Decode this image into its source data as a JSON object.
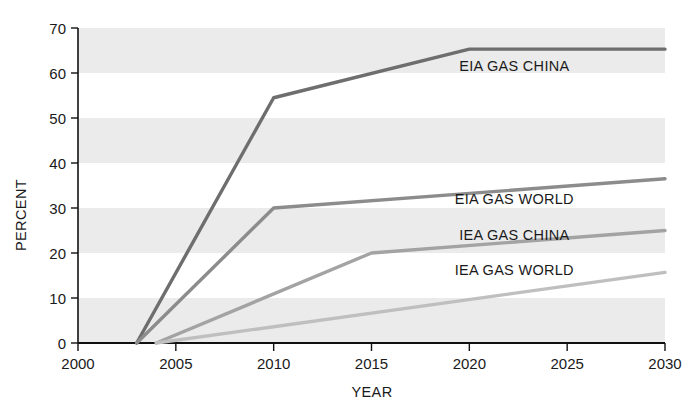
{
  "chart_data": {
    "type": "line",
    "title": "",
    "xlabel": "YEAR",
    "ylabel": "PERCENT",
    "xlim": [
      2000,
      2030
    ],
    "ylim": [
      0,
      70
    ],
    "xticks": [
      2000,
      2005,
      2010,
      2015,
      2020,
      2025,
      2030
    ],
    "yticks": [
      0,
      10,
      20,
      30,
      40,
      50,
      60,
      70
    ],
    "grid": false,
    "banding": "alternating horizontal grey bands every 20 percent starting at 0",
    "legend_position": "inline-annotations",
    "series": [
      {
        "name": "EIA GAS CHINA",
        "color": "#6e6e6e",
        "label_x": 2022.3,
        "label_y": 61.5,
        "points": [
          {
            "x": 2003.0,
            "y": 0.0
          },
          {
            "x": 2010.0,
            "y": 54.5
          },
          {
            "x": 2020.0,
            "y": 65.3
          },
          {
            "x": 2030.0,
            "y": 65.3
          }
        ]
      },
      {
        "name": "EIA GAS WORLD",
        "color": "#8c8c8c",
        "label_x": 2022.3,
        "label_y": 32.0,
        "points": [
          {
            "x": 2003.0,
            "y": 0.0
          },
          {
            "x": 2010.0,
            "y": 30.0
          },
          {
            "x": 2030.0,
            "y": 36.5
          }
        ]
      },
      {
        "name": "IEA GAS CHINA",
        "color": "#a3a3a3",
        "label_x": 2022.3,
        "label_y": 24.0,
        "points": [
          {
            "x": 2004.0,
            "y": 0.0
          },
          {
            "x": 2015.0,
            "y": 20.0
          },
          {
            "x": 2030.0,
            "y": 25.0
          }
        ]
      },
      {
        "name": "IEA GAS WORLD",
        "color": "#bfbfbf",
        "label_x": 2022.3,
        "label_y": 16.2,
        "points": [
          {
            "x": 2004.0,
            "y": 0.0
          },
          {
            "x": 2030.0,
            "y": 15.7
          }
        ]
      }
    ]
  },
  "colors": {
    "axis": "#111111",
    "band": "#ebebeb",
    "plot_background": "#ffffff",
    "text": "#1a1a1a"
  }
}
